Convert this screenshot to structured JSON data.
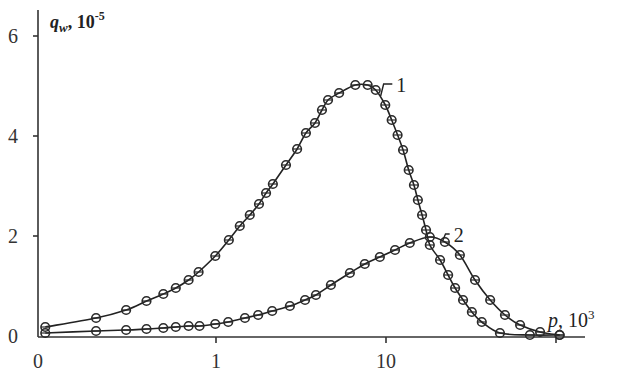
{
  "chart_data": {
    "type": "line",
    "title": "",
    "ylabel": "q_w, 10^-5",
    "ylabel_parts": {
      "symbol": "q",
      "subscript": "w",
      "sep": ",",
      "scale": " 10",
      "exp": "-5"
    },
    "xlabel": "p, 10^3",
    "xlabel_parts": {
      "symbol": "p",
      "scale": ", 10",
      "exp": "3"
    },
    "xscale": "log",
    "x_tick_labels": [
      "0",
      "1",
      "10"
    ],
    "x_ticks": [
      {
        "label": "0",
        "value": 0.09
      },
      {
        "label": "1",
        "value": 1
      },
      {
        "label": "10",
        "value": 10
      },
      {
        "label": "",
        "value": 100
      }
    ],
    "y_ticks": [
      0,
      2,
      4,
      6
    ],
    "xlim": [
      0.09,
      130
    ],
    "ylim": [
      0,
      6.4
    ],
    "grid": false,
    "legend": "inline curve labels",
    "series": [
      {
        "name": "1",
        "x": [
          0.099,
          0.197,
          0.296,
          0.39,
          0.49,
          0.58,
          0.69,
          0.79,
          0.99,
          1.19,
          1.38,
          1.58,
          1.79,
          1.97,
          2.16,
          2.58,
          3.0,
          3.38,
          3.82,
          4.2,
          4.56,
          5.3,
          6.6,
          7.8,
          8.7,
          9.9,
          10.8,
          11.7,
          12.6,
          13.6,
          14.6,
          15.4,
          16.3,
          17.2,
          18.1,
          20.8,
          23.2,
          25.5,
          28.4,
          32.0,
          36.6,
          46.8,
          70.2,
          105
        ],
        "values": [
          0.18,
          0.36,
          0.52,
          0.7,
          0.84,
          0.96,
          1.12,
          1.28,
          1.6,
          1.92,
          2.2,
          2.42,
          2.64,
          2.86,
          3.04,
          3.42,
          3.74,
          4.06,
          4.26,
          4.52,
          4.72,
          4.86,
          5.02,
          5.02,
          4.92,
          4.62,
          4.32,
          4.02,
          3.72,
          3.32,
          3.02,
          2.72,
          2.42,
          2.12,
          1.82,
          1.52,
          1.22,
          0.96,
          0.72,
          0.48,
          0.28,
          0.06,
          0.02,
          0.02
        ]
      },
      {
        "name": "2",
        "x": [
          0.099,
          0.197,
          0.296,
          0.39,
          0.49,
          0.58,
          0.69,
          0.8,
          0.99,
          1.18,
          1.48,
          1.77,
          2.14,
          2.72,
          3.34,
          3.87,
          4.74,
          6.13,
          7.5,
          9.2,
          11.3,
          13.8,
          18.1,
          22.2,
          27.2,
          33.4,
          41.0,
          50.1,
          61.5,
          80.6,
          105
        ],
        "values": [
          0.06,
          0.1,
          0.12,
          0.14,
          0.16,
          0.18,
          0.2,
          0.2,
          0.24,
          0.28,
          0.36,
          0.42,
          0.5,
          0.6,
          0.72,
          0.82,
          1.02,
          1.26,
          1.44,
          1.58,
          1.72,
          1.86,
          1.98,
          1.88,
          1.62,
          1.12,
          0.72,
          0.42,
          0.22,
          0.08,
          0.02
        ]
      }
    ],
    "annotations": [
      {
        "text": "1",
        "series": "1",
        "anchor_x": 9.3,
        "anchor_y": 4.8,
        "label_x": 11.5,
        "label_y": 5.0
      },
      {
        "text": "2",
        "series": "2",
        "anchor_x": 21.5,
        "anchor_y": 1.9,
        "label_x": 25,
        "label_y": 2.0
      }
    ],
    "colors": {
      "line": "#222222",
      "marker": "#2a2a2a",
      "axis": "#333333",
      "background": "#ffffff"
    }
  }
}
